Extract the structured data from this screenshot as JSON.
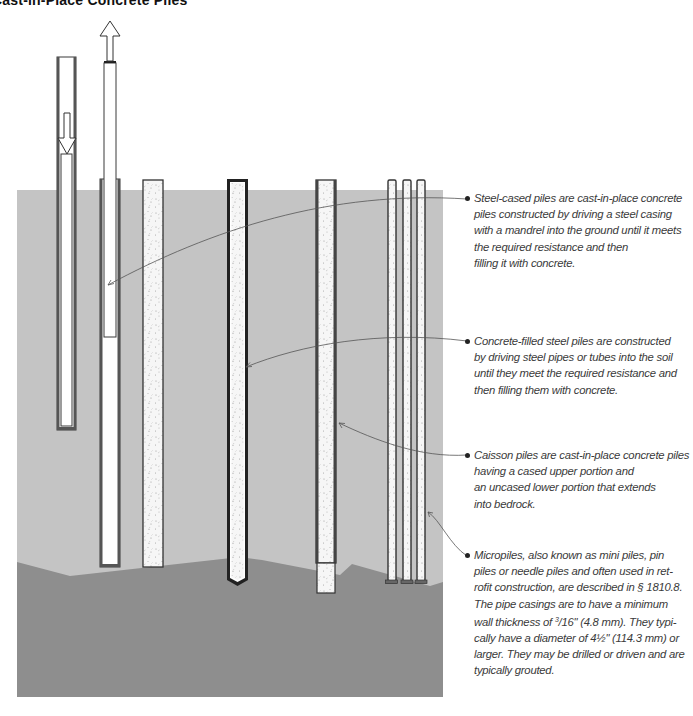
{
  "title": "Cast-in-Place Concrete Piles",
  "colors": {
    "soil": "#c4c4c4",
    "bedrock": "#8e8e8e",
    "casing": "#3a3a3a",
    "concrete": "#f4f4f4",
    "leader": "#555555",
    "text": "#3a3a3a"
  },
  "diagram": {
    "layers": [
      "soil",
      "bedrock"
    ],
    "piles": [
      {
        "name": "mandrel-driving-casing",
        "description": "Steel casing being driven by mandrel (down arrow)"
      },
      {
        "name": "mandrel-withdrawn",
        "description": "Mandrel withdrawn from casing (up arrow)"
      },
      {
        "name": "steel-cased-pile-filled",
        "description": "Steel-cased pile filled with concrete"
      },
      {
        "name": "concrete-filled-steel-pile",
        "description": "Steel pipe pile filled with concrete"
      },
      {
        "name": "caisson-pile",
        "description": "Cased upper portion, uncased socket into bedrock"
      },
      {
        "name": "micropiles",
        "description": "Three slender grouted micropiles"
      }
    ]
  },
  "annotations": [
    {
      "id": "steel-cased",
      "text": "Steel-cased piles are cast-in-place concrete\npiles constructed by driving a steel casing\nwith a mandrel into the ground until it meets\nthe required resistance and then\nfilling it with concrete."
    },
    {
      "id": "concrete-filled",
      "text": "Concrete-filled steel piles are constructed\nby driving steel pipes or tubes into the soil\nuntil they meet the required resistance and\nthen filling them with concrete."
    },
    {
      "id": "caisson",
      "text": "Caisson piles are cast-in-place concrete piles\nhaving a cased upper portion and\nan uncased lower portion that extends\ninto bedrock."
    },
    {
      "id": "micropiles",
      "line1": "Micropiles, also known as mini piles, pin",
      "line2": "piles or needle piles and often used in ret-",
      "line3": "rofit construction, are described in § 1810.8.",
      "line4": "The pipe casings are to have a minimum",
      "line5a": "wall thickness of ",
      "frac_num": "3",
      "frac_den": "/16\"",
      "line5b": " (4.8 mm). They typi-",
      "line6": "cally have a diameter of 4½\" (114.3 mm) or",
      "line7": "larger. They may be drilled or driven and are",
      "line8": "typically grouted."
    }
  ]
}
